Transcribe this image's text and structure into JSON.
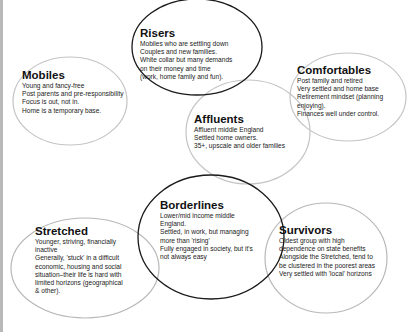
{
  "diagram": {
    "type": "segment bubbles",
    "segments": [
      {
        "id": "risers",
        "title": "Risers",
        "emphasis": true,
        "lines": [
          "Mobiles who are settling down",
          "Couples and new families.",
          "White collar but many demands",
          "on their money and time",
          "(work, home family and fun)."
        ]
      },
      {
        "id": "mobiles",
        "title": "Mobiles",
        "emphasis": false,
        "lines": [
          "Young and fancy-free",
          "Post parents and pre-responsibility",
          "Focus is out, not in.",
          "Home is a temporary base."
        ]
      },
      {
        "id": "comfortables",
        "title": "Comfortables",
        "emphasis": false,
        "lines": [
          "Post family and retired",
          "Very settled and  home base",
          "Retirement mindset (planning",
          "enjoying).",
          "Finances well under control."
        ]
      },
      {
        "id": "affluents",
        "title": "Affluents",
        "emphasis": false,
        "lines": [
          "Affluent middle England",
          "Settled home owners.",
          "35+, upscale and older families"
        ]
      },
      {
        "id": "borderlines",
        "title": "Borderlines",
        "emphasis": true,
        "lines": [
          "Lower/mid income middle",
          "England.",
          "Settled, in work, but managing",
          "more than 'rising'",
          "Fully engaged in society, but it's",
          "not always easy"
        ]
      },
      {
        "id": "stretched",
        "title": "Stretched",
        "emphasis": false,
        "lines": [
          "Younger, striving, financially",
          "inactive",
          "Generally, 'stuck' in a difficult",
          "economic, housing and social",
          "situation–their life is hard with",
          "limited horizons (geographical",
          "& other)."
        ]
      },
      {
        "id": "survivors",
        "title": "Survivors",
        "emphasis": false,
        "lines": [
          "Oldest group with high",
          "dependence on state benefits",
          "Alongside the Stretched, tend to",
          "be clustered in the poorest areas",
          "Very settled with 'local' horizons"
        ]
      }
    ],
    "colors": {
      "emphasis_outline": "#1a1a1a",
      "light_outline": "#bdbdbd",
      "text": "#222222",
      "background": "#ffffff"
    }
  }
}
